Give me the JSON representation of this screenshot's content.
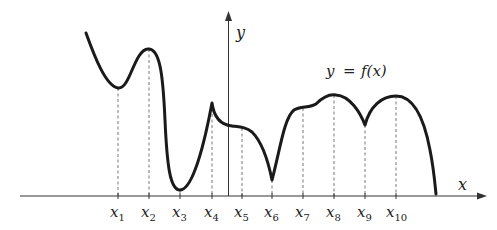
{
  "diagram": {
    "axes": {
      "x_label": "x",
      "y_label": "y"
    },
    "function_label": {
      "lhs": "y",
      "eq": "=",
      "rhs": "f(x)"
    },
    "points": [
      {
        "name": "x",
        "sub": "1",
        "feature": "local minimum"
      },
      {
        "name": "x",
        "sub": "2",
        "feature": "local maximum"
      },
      {
        "name": "x",
        "sub": "3",
        "feature": "local minimum"
      },
      {
        "name": "x",
        "sub": "4",
        "feature": "cusp (local maximum)"
      },
      {
        "name": "x",
        "sub": "5",
        "feature": "inflection / flat point"
      },
      {
        "name": "x",
        "sub": "6",
        "feature": "cusp (local minimum)"
      },
      {
        "name": "x",
        "sub": "7",
        "feature": "flat point"
      },
      {
        "name": "x",
        "sub": "8",
        "feature": "local maximum"
      },
      {
        "name": "x",
        "sub": "9",
        "feature": "cusp (local minimum)"
      },
      {
        "name": "x",
        "sub": "10",
        "feature": "local maximum"
      }
    ],
    "colors": {
      "curve": "#1a1a1a",
      "axes": "#333333",
      "guides": "#555555"
    }
  }
}
